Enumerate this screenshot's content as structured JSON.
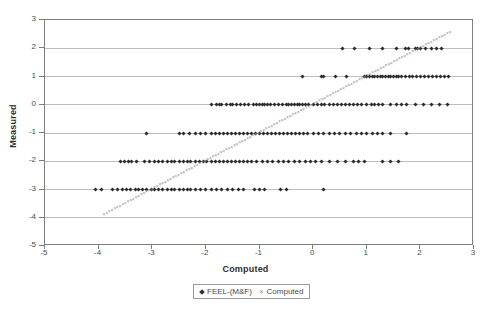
{
  "chart_data": {
    "type": "scatter",
    "title": "",
    "xlabel": "Computed",
    "ylabel": "Measured",
    "xlim": [
      -5,
      3
    ],
    "ylim": [
      -5,
      3
    ],
    "xticks": [
      -5,
      -4,
      -3,
      -2,
      -1,
      0,
      1,
      2,
      3
    ],
    "yticks": [
      -5,
      -4,
      -3,
      -2,
      -1,
      0,
      1,
      2,
      3
    ],
    "grid": "horizontal",
    "legend_position": "bottom-center",
    "series": [
      {
        "name": "FEEL-(M&F)",
        "marker": "diamond",
        "color": "#2b2b2b",
        "points": [
          [
            0.55,
            2
          ],
          [
            0.78,
            2
          ],
          [
            1.05,
            2
          ],
          [
            1.3,
            2
          ],
          [
            1.55,
            2
          ],
          [
            1.72,
            2
          ],
          [
            1.78,
            2
          ],
          [
            1.9,
            2
          ],
          [
            1.95,
            2
          ],
          [
            2.0,
            2
          ],
          [
            2.1,
            2
          ],
          [
            2.2,
            2
          ],
          [
            2.3,
            2
          ],
          [
            2.4,
            2
          ],
          [
            -0.2,
            1
          ],
          [
            0.15,
            1
          ],
          [
            0.2,
            1
          ],
          [
            0.42,
            1
          ],
          [
            0.62,
            1
          ],
          [
            0.95,
            1
          ],
          [
            1.0,
            1
          ],
          [
            1.05,
            1
          ],
          [
            1.1,
            1
          ],
          [
            1.15,
            1
          ],
          [
            1.2,
            1
          ],
          [
            1.25,
            1
          ],
          [
            1.3,
            1
          ],
          [
            1.35,
            1
          ],
          [
            1.4,
            1
          ],
          [
            1.45,
            1
          ],
          [
            1.5,
            1
          ],
          [
            1.55,
            1
          ],
          [
            1.6,
            1
          ],
          [
            1.65,
            1
          ],
          [
            1.72,
            1
          ],
          [
            1.8,
            1
          ],
          [
            1.85,
            1
          ],
          [
            1.92,
            1
          ],
          [
            2.0,
            1
          ],
          [
            2.08,
            1
          ],
          [
            2.15,
            1
          ],
          [
            2.22,
            1
          ],
          [
            2.3,
            1
          ],
          [
            2.38,
            1
          ],
          [
            2.45,
            1
          ],
          [
            2.52,
            1
          ],
          [
            -1.9,
            0
          ],
          [
            -1.8,
            0
          ],
          [
            -1.75,
            0
          ],
          [
            -1.7,
            0
          ],
          [
            -1.62,
            0
          ],
          [
            -1.55,
            0
          ],
          [
            -1.5,
            0
          ],
          [
            -1.42,
            0
          ],
          [
            -1.35,
            0
          ],
          [
            -1.28,
            0
          ],
          [
            -1.2,
            0
          ],
          [
            -1.12,
            0
          ],
          [
            -1.05,
            0
          ],
          [
            -1.0,
            0
          ],
          [
            -0.95,
            0
          ],
          [
            -0.9,
            0
          ],
          [
            -0.85,
            0
          ],
          [
            -0.8,
            0
          ],
          [
            -0.72,
            0
          ],
          [
            -0.65,
            0
          ],
          [
            -0.58,
            0
          ],
          [
            -0.5,
            0
          ],
          [
            -0.45,
            0
          ],
          [
            -0.4,
            0
          ],
          [
            -0.35,
            0
          ],
          [
            -0.3,
            0
          ],
          [
            -0.25,
            0
          ],
          [
            -0.2,
            0
          ],
          [
            -0.15,
            0
          ],
          [
            -0.08,
            0
          ],
          [
            0.0,
            0
          ],
          [
            0.08,
            0
          ],
          [
            0.15,
            0
          ],
          [
            0.22,
            0
          ],
          [
            0.3,
            0
          ],
          [
            0.38,
            0
          ],
          [
            0.45,
            0
          ],
          [
            0.52,
            0
          ],
          [
            0.6,
            0
          ],
          [
            0.68,
            0
          ],
          [
            0.75,
            0
          ],
          [
            0.82,
            0
          ],
          [
            0.9,
            0
          ],
          [
            1.0,
            0
          ],
          [
            1.08,
            0
          ],
          [
            1.15,
            0
          ],
          [
            1.22,
            0
          ],
          [
            1.3,
            0
          ],
          [
            1.45,
            0
          ],
          [
            1.55,
            0
          ],
          [
            1.65,
            0
          ],
          [
            1.75,
            0
          ],
          [
            1.9,
            0
          ],
          [
            2.05,
            0
          ],
          [
            2.2,
            0
          ],
          [
            2.35,
            0
          ],
          [
            2.5,
            0
          ],
          [
            -3.1,
            -1
          ],
          [
            -2.5,
            -1
          ],
          [
            -2.42,
            -1
          ],
          [
            -2.3,
            -1
          ],
          [
            -2.2,
            -1
          ],
          [
            -2.1,
            -1
          ],
          [
            -2.0,
            -1
          ],
          [
            -1.9,
            -1
          ],
          [
            -1.82,
            -1
          ],
          [
            -1.75,
            -1
          ],
          [
            -1.68,
            -1
          ],
          [
            -1.6,
            -1
          ],
          [
            -1.52,
            -1
          ],
          [
            -1.45,
            -1
          ],
          [
            -1.38,
            -1
          ],
          [
            -1.3,
            -1
          ],
          [
            -1.22,
            -1
          ],
          [
            -1.15,
            -1
          ],
          [
            -1.08,
            -1
          ],
          [
            -1.0,
            -1
          ],
          [
            -0.92,
            -1
          ],
          [
            -0.85,
            -1
          ],
          [
            -0.78,
            -1
          ],
          [
            -0.7,
            -1
          ],
          [
            -0.62,
            -1
          ],
          [
            -0.55,
            -1
          ],
          [
            -0.48,
            -1
          ],
          [
            -0.4,
            -1
          ],
          [
            -0.32,
            -1
          ],
          [
            -0.25,
            -1
          ],
          [
            -0.18,
            -1
          ],
          [
            -0.1,
            -1
          ],
          [
            0.0,
            -1
          ],
          [
            0.1,
            -1
          ],
          [
            0.2,
            -1
          ],
          [
            0.3,
            -1
          ],
          [
            0.4,
            -1
          ],
          [
            0.5,
            -1
          ],
          [
            0.6,
            -1
          ],
          [
            0.7,
            -1
          ],
          [
            0.8,
            -1
          ],
          [
            0.9,
            -1
          ],
          [
            1.0,
            -1
          ],
          [
            1.1,
            -1
          ],
          [
            1.2,
            -1
          ],
          [
            1.3,
            -1
          ],
          [
            1.45,
            -1
          ],
          [
            1.75,
            -1
          ],
          [
            -3.6,
            -2
          ],
          [
            -3.52,
            -2
          ],
          [
            -3.45,
            -2
          ],
          [
            -3.38,
            -2
          ],
          [
            -3.3,
            -2
          ],
          [
            -3.15,
            -2
          ],
          [
            -3.05,
            -2
          ],
          [
            -2.95,
            -2
          ],
          [
            -2.88,
            -2
          ],
          [
            -2.8,
            -2
          ],
          [
            -2.72,
            -2
          ],
          [
            -2.65,
            -2
          ],
          [
            -2.58,
            -2
          ],
          [
            -2.5,
            -2
          ],
          [
            -2.42,
            -2
          ],
          [
            -2.35,
            -2
          ],
          [
            -2.28,
            -2
          ],
          [
            -2.2,
            -2
          ],
          [
            -2.12,
            -2
          ],
          [
            -2.05,
            -2
          ],
          [
            -1.98,
            -2
          ],
          [
            -1.9,
            -2
          ],
          [
            -1.82,
            -2
          ],
          [
            -1.75,
            -2
          ],
          [
            -1.68,
            -2
          ],
          [
            -1.6,
            -2
          ],
          [
            -1.52,
            -2
          ],
          [
            -1.45,
            -2
          ],
          [
            -1.38,
            -2
          ],
          [
            -1.3,
            -2
          ],
          [
            -1.22,
            -2
          ],
          [
            -1.15,
            -2
          ],
          [
            -1.05,
            -2
          ],
          [
            -0.95,
            -2
          ],
          [
            -0.85,
            -2
          ],
          [
            -0.75,
            -2
          ],
          [
            -0.65,
            -2
          ],
          [
            -0.55,
            -2
          ],
          [
            -0.45,
            -2
          ],
          [
            -0.35,
            -2
          ],
          [
            -0.25,
            -2
          ],
          [
            -0.15,
            -2
          ],
          [
            -0.05,
            -2
          ],
          [
            0.05,
            -2
          ],
          [
            0.15,
            -2
          ],
          [
            0.3,
            -2
          ],
          [
            0.45,
            -2
          ],
          [
            0.6,
            -2
          ],
          [
            0.75,
            -2
          ],
          [
            0.85,
            -2
          ],
          [
            0.95,
            -2
          ],
          [
            1.3,
            -2
          ],
          [
            1.45,
            -2
          ],
          [
            1.6,
            -2
          ],
          [
            -4.05,
            -3
          ],
          [
            -3.95,
            -3
          ],
          [
            -3.75,
            -3
          ],
          [
            -3.65,
            -3
          ],
          [
            -3.55,
            -3
          ],
          [
            -3.48,
            -3
          ],
          [
            -3.4,
            -3
          ],
          [
            -3.32,
            -3
          ],
          [
            -3.25,
            -3
          ],
          [
            -3.18,
            -3
          ],
          [
            -3.1,
            -3
          ],
          [
            -3.02,
            -3
          ],
          [
            -2.95,
            -3
          ],
          [
            -2.88,
            -3
          ],
          [
            -2.8,
            -3
          ],
          [
            -2.72,
            -3
          ],
          [
            -2.65,
            -3
          ],
          [
            -2.58,
            -3
          ],
          [
            -2.5,
            -3
          ],
          [
            -2.42,
            -3
          ],
          [
            -2.35,
            -3
          ],
          [
            -2.28,
            -3
          ],
          [
            -2.2,
            -3
          ],
          [
            -2.1,
            -3
          ],
          [
            -2.0,
            -3
          ],
          [
            -1.9,
            -3
          ],
          [
            -1.8,
            -3
          ],
          [
            -1.7,
            -3
          ],
          [
            -1.6,
            -3
          ],
          [
            -1.5,
            -3
          ],
          [
            -1.4,
            -3
          ],
          [
            -1.3,
            -3
          ],
          [
            -1.1,
            -3
          ],
          [
            -1.0,
            -3
          ],
          [
            -0.9,
            -3
          ],
          [
            -0.6,
            -3
          ],
          [
            -0.5,
            -3
          ],
          [
            0.2,
            -3
          ]
        ]
      },
      {
        "name": "Computed",
        "marker": "cross",
        "color": "#949494",
        "description": "Identity line y = x, dense x markers from about -3.9 to 2.5",
        "line_from": [
          -3.9,
          -3.9
        ],
        "line_to": [
          2.55,
          2.55
        ],
        "n_points": 130
      }
    ]
  },
  "axes": {
    "x_title": "Computed",
    "y_title": "Measured",
    "x_ticks": [
      "-5",
      "-4",
      "-3",
      "-2",
      "-1",
      "0",
      "1",
      "2",
      "3"
    ],
    "y_ticks": [
      "3",
      "2",
      "1",
      "0",
      "-1",
      "-2",
      "-3",
      "-4",
      "-5"
    ]
  },
  "legend": {
    "entries": [
      {
        "label": "FEEL-(M&F)",
        "marker": "diamond-marker"
      },
      {
        "label": "Computed",
        "marker": "cross-marker"
      }
    ]
  }
}
